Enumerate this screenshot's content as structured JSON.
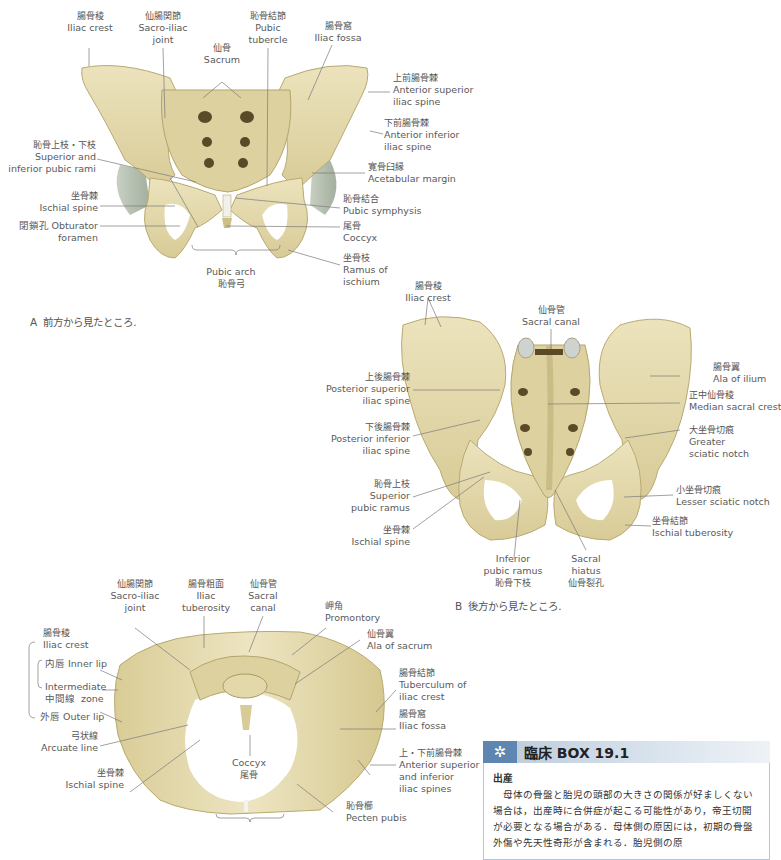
{
  "colors": {
    "bone": "#e6dcb0",
    "bone_shadow": "#c9bc86",
    "bone_dark": "#a99a62",
    "leader": "#7a7a7a",
    "text": "#555555",
    "box_accent": "#5f86b0",
    "box_header": "#c6d3e1",
    "box_border": "#b7c6d6"
  },
  "figure_a": {
    "caption_letter": "A",
    "caption_text": "前方から見たところ.",
    "labels": {
      "iliac_crest": {
        "jp": "腸骨稜",
        "en": "Iliac crest"
      },
      "sacroiliac_joint": {
        "jp": "仙腸関節",
        "en1": "Sacro-iliac",
        "en2": "joint"
      },
      "sacrum": {
        "jp": "仙骨",
        "en": "Sacrum"
      },
      "pubic_tubercle": {
        "jp": "恥骨結節",
        "en1": "Pubic",
        "en2": "tubercle"
      },
      "iliac_fossa": {
        "jp": "腸骨窩",
        "en": "Iliac fossa"
      },
      "asis": {
        "jp": "上前腸骨棘",
        "en1": "Anterior superior",
        "en2": "iliac spine"
      },
      "aiis": {
        "jp": "下前腸骨棘",
        "en1": "Anterior inferior",
        "en2": "iliac spine"
      },
      "acetabular_margin": {
        "jp": "寛骨臼縁",
        "en": "Acetabular margin"
      },
      "pubic_symphysis": {
        "jp": "恥骨結合",
        "en": "Pubic symphysis"
      },
      "coccyx": {
        "jp": "尾骨",
        "en": "Coccyx"
      },
      "ramus_ischium": {
        "jp": "坐骨枝",
        "en1": "Ramus of",
        "en2": "ischium"
      },
      "pubic_rami": {
        "jp": "恥骨上枝・下枝",
        "en1": "Superior and",
        "en2": "inferior pubic rami"
      },
      "ischial_spine": {
        "jp": "坐骨棘",
        "en": "Ischial spine"
      },
      "obturator": {
        "jp": "閉鎖孔",
        "en1": "Obturator",
        "en2": "foramen"
      },
      "pubic_arch": {
        "en": "Pubic arch",
        "jp": "恥骨弓"
      }
    }
  },
  "figure_b": {
    "caption_letter": "B",
    "caption_text": "後方から見たところ.",
    "labels": {
      "iliac_crest": {
        "jp": "腸骨稜",
        "en": "Iliac crest"
      },
      "sacral_canal": {
        "jp": "仙骨管",
        "en": "Sacral canal"
      },
      "ala_ilium": {
        "jp": "腸骨翼",
        "en": "Ala of ilium"
      },
      "median_sacral_crest": {
        "jp": "正中仙骨稜",
        "en": "Median sacral crest"
      },
      "greater_sciatic": {
        "jp": "大坐骨切痕",
        "en1": "Greater",
        "en2": "sciatic notch"
      },
      "lesser_sciatic": {
        "jp": "小坐骨切痕",
        "en": "Lesser sciatic notch"
      },
      "ischial_tuberosity": {
        "jp": "坐骨結節",
        "en": "Ischial tuberosity"
      },
      "psis": {
        "jp": "上後腸骨棘",
        "en1": "Posterior superior",
        "en2": "iliac spine"
      },
      "piis": {
        "jp": "下後腸骨棘",
        "en1": "Posterior inferior",
        "en2": "iliac spine"
      },
      "superior_pubic_ramus": {
        "jp": "恥骨上枝",
        "en1": "Superior",
        "en2": "pubic ramus"
      },
      "ischial_spine": {
        "jp": "坐骨棘",
        "en": "Ischial spine"
      },
      "inferior_pubic_ramus": {
        "en1": "Inferior",
        "en2": "pubic ramus",
        "jp": "恥骨下枝"
      },
      "sacral_hiatus": {
        "en1": "Sacral",
        "en2": "hiatus",
        "jp": "仙骨裂孔"
      }
    }
  },
  "figure_c": {
    "labels": {
      "sacroiliac_joint": {
        "jp": "仙腸関節",
        "en1": "Sacro-iliac",
        "en2": "joint"
      },
      "iliac_tuberosity": {
        "jp": "腸骨粗面",
        "en1": "Iliac",
        "en2": "tuberosity"
      },
      "sacral_canal": {
        "jp": "仙骨管",
        "en1": "Sacral",
        "en2": "canal"
      },
      "promontory": {
        "jp": "岬角",
        "en": "Promontory"
      },
      "ala_sacrum": {
        "jp": "仙骨翼",
        "en": "Ala of sacrum"
      },
      "tuberculum": {
        "jp": "腸骨結節",
        "en1": "Tuberculum of",
        "en2": "iliac crest"
      },
      "iliac_fossa": {
        "jp": "腸骨窩",
        "en": "Iliac fossa"
      },
      "spines": {
        "jp": "上・下前腸骨棘",
        "en1": "Anterior superior",
        "en2": "and inferior",
        "en3": "iliac spines"
      },
      "pecten_pubis": {
        "jp": "恥骨櫛",
        "en": "Pecten pubis"
      },
      "iliac_crest": {
        "jp": "腸骨稜",
        "en": "Iliac crest"
      },
      "inner_lip": {
        "jp": "内唇",
        "en": "Inner lip"
      },
      "intermediate": {
        "en": "Intermediate",
        "jp": "中間線",
        "en2": "zone"
      },
      "outer_lip": {
        "jp": "外唇",
        "en": "Outer lip"
      },
      "arcuate_line": {
        "jp": "弓状線",
        "en": "Arcuate line"
      },
      "ischial_spine": {
        "jp": "坐骨棘",
        "en": "Ischial spine"
      },
      "coccyx": {
        "en": "Coccyx",
        "jp": "尾骨"
      }
    }
  },
  "clinical_box": {
    "icon": "✲",
    "title": "臨床 BOX 19.1",
    "subtitle": "出産",
    "text": "母体の骨盤と胎児の頭部の大きさの関係が好ましくない場合は，出産時に合併症が起こる可能性があり，帝王切開が必要となる場合がある．母体側の原因には，初期の骨盤外傷や先天性奇形が含まれる．胎児側の原"
  }
}
